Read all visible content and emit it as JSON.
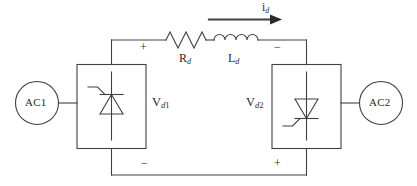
{
  "diagram": {
    "type": "circuit-schematic",
    "stroke_color": "#404040",
    "text_color": "#2b2b2b",
    "background": "#ffffff"
  },
  "sources": {
    "left": {
      "label": "AC1",
      "name": "ac-source-1"
    },
    "right": {
      "label": "AC2",
      "name": "ac-source-2"
    }
  },
  "converters": {
    "left": {
      "voltage_label_base": "V",
      "voltage_label_sub_italic": "d",
      "voltage_label_sub_num": "1",
      "device": "thyristor",
      "orientation": "apex-up",
      "top_polarity": "+",
      "bottom_polarity": "−"
    },
    "right": {
      "voltage_label_base": "V",
      "voltage_label_sub_italic": "d",
      "voltage_label_sub_num": "2",
      "device": "thyristor",
      "orientation": "apex-down",
      "top_polarity": "−",
      "bottom_polarity": "+"
    }
  },
  "dc_line": {
    "resistor": {
      "base": "R",
      "sub": "d",
      "symbol": "zigzag",
      "peaks": 3
    },
    "inductor": {
      "base": "L",
      "sub": "d",
      "symbol": "coil",
      "humps": 4
    },
    "current": {
      "base": "i",
      "sub": "d",
      "arrow_direction": "right"
    }
  }
}
